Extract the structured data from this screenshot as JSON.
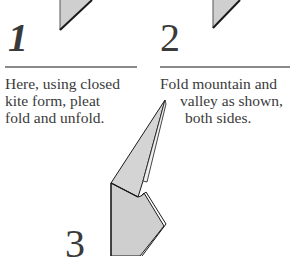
{
  "steps": [
    {
      "number": "1",
      "caption_lines": [
        "Here, using closed",
        "kite form, pleat",
        "fold and unfold."
      ]
    },
    {
      "number": "2",
      "caption_lines": [
        "Fold mountain and",
        "valley as shown,",
        "both sides."
      ]
    },
    {
      "number": "3",
      "caption_lines": []
    }
  ],
  "colors": {
    "paper_fill": "#cfcfcf",
    "outline": "#1a1a1a",
    "rule": "#8a8a8a",
    "text": "#3a3a3a"
  }
}
